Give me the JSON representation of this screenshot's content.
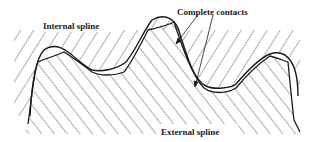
{
  "diagram": {
    "type": "spline-contact-cross-section",
    "labels": {
      "internal_spline": "Internal spline",
      "complete_contacts": "Complete contacts",
      "external_spline": "External spline"
    },
    "colors": {
      "background": "#ffffff",
      "outline": "#1a1a1a",
      "hatch": "#333333",
      "text": "#1a1a1a"
    },
    "regions": [
      {
        "name": "internal-spline",
        "position": "upper",
        "hatch_direction": "down-right"
      },
      {
        "name": "external-spline",
        "position": "lower",
        "hatch_direction": "up-right"
      }
    ],
    "contact_points": 2,
    "teeth_visible": 3
  }
}
